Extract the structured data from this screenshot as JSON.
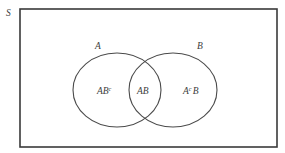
{
  "figure": {
    "kind": "venn-diagram",
    "background_color": "#ffffff",
    "stroke_color": "#3a3a3a",
    "text_color": "#3c3c3c",
    "width": 285,
    "height": 153
  },
  "universe": {
    "label": "S",
    "rect": {
      "x": 20,
      "y": 9,
      "width": 257,
      "height": 138
    }
  },
  "sets": [
    {
      "id": "A",
      "label": "A",
      "label_x": 95,
      "label_y": 49,
      "cx": 117,
      "cy": 90,
      "rx": 44,
      "ry": 37
    },
    {
      "id": "B",
      "label": "B",
      "label_x": 197,
      "label_y": 49,
      "cx": 173,
      "cy": 90,
      "rx": 44,
      "ry": 37
    }
  ],
  "regions": [
    {
      "id": "A-only",
      "base": "AB",
      "superscript": "c",
      "full_label": "ABc",
      "x": 97,
      "y": 94
    },
    {
      "id": "A-and-B",
      "base": "AB",
      "superscript": "",
      "full_label": "AB",
      "x": 137,
      "y": 94
    },
    {
      "id": "B-only",
      "base": "A",
      "superscript": "c",
      "trailing": "B",
      "full_label": "AcB",
      "x": 183,
      "y": 94
    }
  ]
}
